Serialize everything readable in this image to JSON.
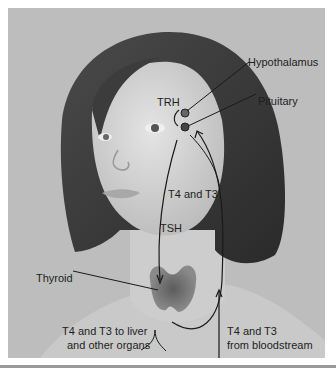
{
  "figure": {
    "labels": {
      "hypothalamus": "Hypothalamus",
      "pituitary": "Pituitary",
      "trh": "TRH",
      "t4_t3_feedback": "T4 and T3",
      "tsh": "TSH",
      "thyroid": "Thyroid",
      "to_organs_line1": "T4 and T3 to liver",
      "to_organs_line2": "and other organs",
      "from_blood_line1": "T4 and T3",
      "from_blood_line2": "from bloodstream"
    },
    "colors": {
      "background": "#bdbdbd",
      "hair": "#3a3a3a",
      "skin": "#d8d8d8",
      "thyroid": "#6a6a6a",
      "line": "#1a1a1a"
    }
  }
}
